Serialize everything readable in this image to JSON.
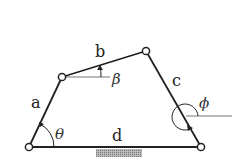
{
  "diagram": {
    "links": {
      "a": "a",
      "b": "b",
      "c": "c",
      "d": "d"
    },
    "angles": {
      "theta": "θ",
      "beta": "β",
      "phi": "ϕ"
    },
    "colors": {
      "link": "#222222",
      "reference_line": "#777777",
      "ground_hatch": "#999999"
    }
  }
}
